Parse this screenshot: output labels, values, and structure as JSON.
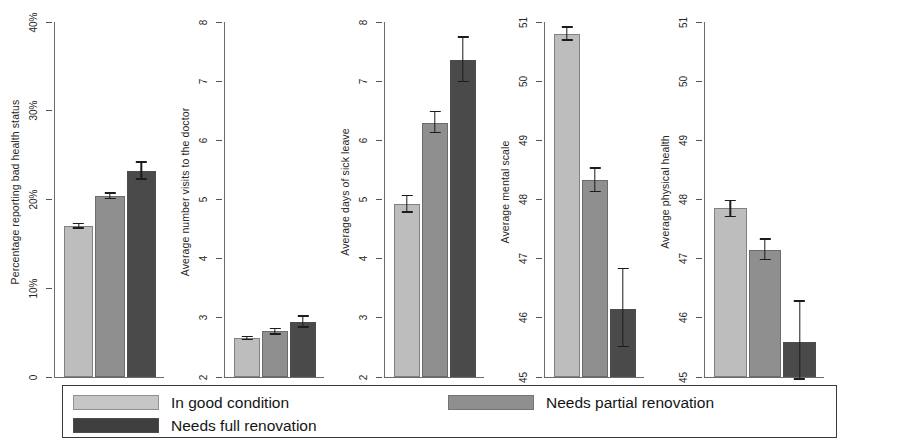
{
  "chart_data": {
    "type": "bar",
    "title": "",
    "categories": [
      "In good condition",
      "Needs partial renovation",
      "Needs full renovation"
    ],
    "legend": {
      "position": "bottom",
      "entries": [
        {
          "label": "In good condition",
          "color": "#c6c6c6"
        },
        {
          "label": "Needs partial renovation",
          "color": "#8f8f8f"
        },
        {
          "label": "Needs full renovation",
          "color": "#3f3f3f"
        }
      ]
    },
    "grid": false,
    "panels": [
      {
        "id": "panel-bad-health",
        "ylabel": "Percentage reporting bad health status",
        "ylim": [
          0,
          40
        ],
        "yticks": [
          0,
          10,
          20,
          30,
          40
        ],
        "yticklabels": [
          "0",
          "10%",
          "20%",
          "30%",
          "40%"
        ],
        "values": [
          17.0,
          20.4,
          23.2
        ],
        "err_low": [
          16.7,
          20.0,
          22.2
        ],
        "err_high": [
          17.4,
          20.8,
          24.3
        ]
      },
      {
        "id": "panel-doctor-visits",
        "ylabel": "Average number visits to the doctor",
        "ylim": [
          2,
          8
        ],
        "yticks": [
          2,
          3,
          4,
          5,
          6,
          7,
          8
        ],
        "yticklabels": [
          "2",
          "3",
          "4",
          "5",
          "6",
          "7",
          "8"
        ],
        "values": [
          2.66,
          2.77,
          2.93
        ],
        "err_low": [
          2.62,
          2.71,
          2.83
        ],
        "err_high": [
          2.7,
          2.83,
          3.04
        ]
      },
      {
        "id": "panel-sick-leave",
        "ylabel": "Average days of sick leave",
        "ylim": [
          2,
          8
        ],
        "yticks": [
          2,
          3,
          4,
          5,
          6,
          7,
          8
        ],
        "yticklabels": [
          "2",
          "3",
          "4",
          "5",
          "6",
          "7",
          "8"
        ],
        "values": [
          4.92,
          6.3,
          7.35
        ],
        "err_low": [
          4.78,
          6.12,
          6.98
        ],
        "err_high": [
          5.08,
          6.5,
          7.76
        ]
      },
      {
        "id": "panel-mental-scale",
        "ylabel": "Average mental scale",
        "ylim": [
          45,
          51
        ],
        "yticks": [
          45,
          46,
          47,
          48,
          49,
          50,
          51
        ],
        "yticklabels": [
          "45",
          "46",
          "47",
          "48",
          "49",
          "50",
          "51"
        ],
        "values": [
          50.8,
          48.33,
          46.15
        ],
        "err_low": [
          50.68,
          48.12,
          45.5
        ],
        "err_high": [
          50.93,
          48.55,
          46.85
        ]
      },
      {
        "id": "panel-physical-health",
        "ylabel": "Average physical health",
        "ylim": [
          45,
          51
        ],
        "yticks": [
          45,
          46,
          47,
          48,
          49,
          50,
          51
        ],
        "yticklabels": [
          "45",
          "46",
          "47",
          "48",
          "49",
          "50",
          "51"
        ],
        "values": [
          47.85,
          47.15,
          45.6
        ],
        "err_low": [
          47.7,
          46.97,
          44.95
        ],
        "err_high": [
          48.0,
          47.35,
          46.3
        ]
      }
    ]
  }
}
